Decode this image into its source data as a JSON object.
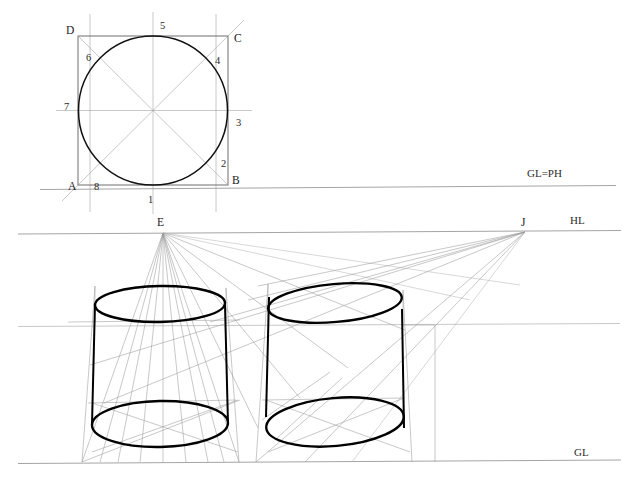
{
  "figure": {
    "type": "technical-drawing"
  },
  "plan": {
    "square_corners": [
      {
        "id": "A",
        "label": "A",
        "x": 78,
        "y": 185
      },
      {
        "id": "B",
        "label": "B",
        "x": 228,
        "y": 185
      },
      {
        "id": "C",
        "label": "C",
        "x": 228,
        "y": 36
      },
      {
        "id": "D",
        "label": "D",
        "x": 78,
        "y": 36
      }
    ],
    "circle_points": [
      {
        "id": "1",
        "label": "1",
        "x": 153,
        "y": 185
      },
      {
        "id": "2",
        "label": "2",
        "x": 216,
        "y": 159
      },
      {
        "id": "3",
        "label": "3",
        "x": 228,
        "y": 110
      },
      {
        "id": "4",
        "label": "4",
        "x": 216,
        "y": 62
      },
      {
        "id": "5",
        "label": "5",
        "x": 153,
        "y": 36
      },
      {
        "id": "6",
        "label": "6",
        "x": 90,
        "y": 62
      },
      {
        "id": "7",
        "label": "7",
        "x": 78,
        "y": 110
      },
      {
        "id": "8",
        "label": "8",
        "x": 90,
        "y": 159
      }
    ],
    "circle": {
      "cx": 153,
      "cy": 110.5,
      "r": 74.5
    }
  },
  "reference_lines": [
    {
      "id": "gl-ph",
      "label": "GL=PH",
      "y": 188,
      "label_x": 527,
      "label_y": 177
    },
    {
      "id": "hl",
      "label": "HL",
      "y": 232,
      "label_x": 572,
      "label_y": 224
    },
    {
      "id": "gl",
      "label": "GL",
      "y": 462,
      "label_x": 575,
      "label_y": 455
    }
  ],
  "vanishing_points": [
    {
      "id": "E",
      "label": "E",
      "x": 163,
      "y": 232,
      "label_x": 158,
      "label_y": 224
    },
    {
      "id": "J",
      "label": "J",
      "x": 525,
      "y": 232,
      "label_x": 524,
      "label_y": 224
    }
  ],
  "cylinders": [
    {
      "id": "left-cylinder",
      "name": "left-cylinder",
      "top_ellipse": {
        "cx": 160,
        "cy": 304,
        "rx": 65,
        "ry": 18,
        "rotate": -1
      },
      "bottom_ellipse": {
        "cx": 160,
        "cy": 424,
        "rx": 68,
        "ry": 23,
        "rotate": -1
      },
      "left_edge_x": 95,
      "right_edge_x": 225
    },
    {
      "id": "right-cylinder",
      "name": "right-cylinder",
      "top_ellipse": {
        "cx": 335,
        "cy": 303,
        "rx": 67,
        "ry": 19,
        "rotate": -5
      },
      "bottom_ellipse": {
        "cx": 335,
        "cy": 422,
        "rx": 69,
        "ry": 24,
        "rotate": -5
      },
      "left_edge_x": 268,
      "right_edge_x": 403
    }
  ],
  "auxiliary": {
    "mid_horizontal_y": 325,
    "mid_horizontal_x1": 18,
    "mid_horizontal_x2": 620,
    "right_vertical_x": 435
  }
}
